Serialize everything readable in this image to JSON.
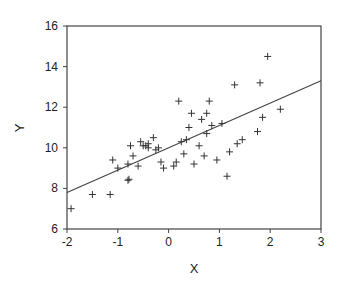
{
  "chart_data": {
    "type": "scatter",
    "title": "",
    "xlabel": "X",
    "ylabel": "Y",
    "xlim": [
      -2,
      3
    ],
    "ylim": [
      6,
      16
    ],
    "xticks": [
      -2,
      -1,
      0,
      1,
      2,
      3
    ],
    "yticks": [
      6,
      8,
      10,
      12,
      14,
      16
    ],
    "grid": false,
    "legend": null,
    "marker": "+",
    "colors": {
      "points": "#333333",
      "line": "#444444",
      "axes": "#444444"
    },
    "series": [
      {
        "name": "observations",
        "points": [
          [
            -1.92,
            7.0
          ],
          [
            -1.5,
            7.7
          ],
          [
            -1.15,
            7.7
          ],
          [
            -1.1,
            9.4
          ],
          [
            -1.0,
            9.0
          ],
          [
            -0.8,
            8.4
          ],
          [
            -0.78,
            8.45
          ],
          [
            -0.8,
            9.2
          ],
          [
            -0.75,
            10.1
          ],
          [
            -0.7,
            9.6
          ],
          [
            -0.6,
            9.1
          ],
          [
            -0.55,
            10.3
          ],
          [
            -0.5,
            10.1
          ],
          [
            -0.45,
            10.1
          ],
          [
            -0.4,
            10.0
          ],
          [
            -0.4,
            10.2
          ],
          [
            -0.3,
            10.5
          ],
          [
            -0.25,
            9.9
          ],
          [
            -0.2,
            10.0
          ],
          [
            -0.15,
            9.3
          ],
          [
            -0.1,
            9.0
          ],
          [
            0.1,
            9.1
          ],
          [
            0.15,
            9.3
          ],
          [
            0.2,
            12.3
          ],
          [
            0.25,
            10.3
          ],
          [
            0.3,
            9.7
          ],
          [
            0.35,
            10.4
          ],
          [
            0.4,
            11.0
          ],
          [
            0.45,
            11.7
          ],
          [
            0.5,
            9.2
          ],
          [
            0.6,
            10.1
          ],
          [
            0.65,
            11.4
          ],
          [
            0.7,
            9.6
          ],
          [
            0.75,
            10.7
          ],
          [
            0.75,
            11.7
          ],
          [
            0.8,
            12.3
          ],
          [
            0.85,
            11.1
          ],
          [
            0.95,
            9.4
          ],
          [
            1.05,
            11.2
          ],
          [
            1.15,
            8.6
          ],
          [
            1.2,
            9.8
          ],
          [
            1.3,
            13.1
          ],
          [
            1.35,
            10.2
          ],
          [
            1.45,
            10.4
          ],
          [
            1.75,
            10.8
          ],
          [
            1.8,
            13.2
          ],
          [
            1.85,
            11.5
          ],
          [
            1.95,
            14.5
          ],
          [
            2.2,
            11.9
          ]
        ]
      }
    ],
    "fit_line": {
      "type": "linear",
      "x": [
        -2,
        3
      ],
      "y": [
        7.8,
        13.3
      ]
    }
  }
}
